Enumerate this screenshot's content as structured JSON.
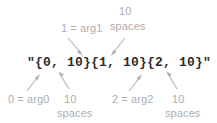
{
  "diagram": {
    "format_string": "\"{0, 10}{1, 10}{2, 10}\"",
    "text_color": "#2b2b2b",
    "label_color": "#b0aeae",
    "arrow_color": "#b5b3b3",
    "background": "#ffffff",
    "labels": {
      "top_arg1": "1 = arg1",
      "top_spaces_number": "10",
      "top_spaces_word": "spaces",
      "bottom_arg0": "0 = arg0",
      "bottom_spaces1_number": "10",
      "bottom_spaces1_word": "spaces",
      "bottom_arg2": "2 = arg2",
      "bottom_spaces2_number": "10",
      "bottom_spaces2_word": "spaces"
    }
  }
}
